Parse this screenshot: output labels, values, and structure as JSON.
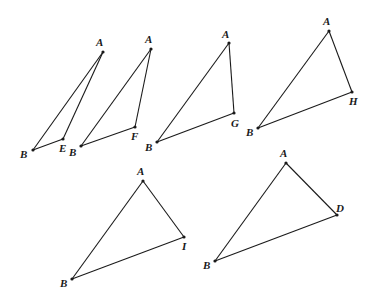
{
  "figure": {
    "width": 381,
    "height": 303,
    "line_color": "#1a1a1a",
    "background": "#ffffff",
    "triangles": [
      {
        "name": "ABE",
        "vertices": {
          "A": {
            "x": 103,
            "y": 52,
            "label": "A",
            "lx": 96,
            "ly": 46
          },
          "B": {
            "x": 33,
            "y": 150,
            "label": "B",
            "lx": 20,
            "ly": 158
          },
          "P": {
            "x": 63,
            "y": 139,
            "label": "E",
            "lx": 59,
            "ly": 152
          }
        }
      },
      {
        "name": "ABF",
        "vertices": {
          "A": {
            "x": 151,
            "y": 49,
            "label": "A",
            "lx": 145,
            "ly": 43
          },
          "B": {
            "x": 81,
            "y": 146,
            "label": "B",
            "lx": 69,
            "ly": 156
          },
          "P": {
            "x": 135,
            "y": 127,
            "label": "F",
            "lx": 131,
            "ly": 140
          }
        }
      },
      {
        "name": "ABG",
        "vertices": {
          "A": {
            "x": 229,
            "y": 43,
            "label": "A",
            "lx": 222,
            "ly": 38
          },
          "B": {
            "x": 157,
            "y": 142,
            "label": "B",
            "lx": 145,
            "ly": 151
          },
          "P": {
            "x": 234,
            "y": 113,
            "label": "G",
            "lx": 231,
            "ly": 127
          }
        }
      },
      {
        "name": "ABH",
        "vertices": {
          "A": {
            "x": 329,
            "y": 31,
            "label": "A",
            "lx": 323,
            "ly": 25
          },
          "B": {
            "x": 258,
            "y": 128,
            "label": "B",
            "lx": 246,
            "ly": 136
          },
          "P": {
            "x": 352,
            "y": 92,
            "label": "H",
            "lx": 349,
            "ly": 105
          }
        }
      },
      {
        "name": "ABI",
        "vertices": {
          "A": {
            "x": 143,
            "y": 181,
            "label": "A",
            "lx": 137,
            "ly": 175
          },
          "B": {
            "x": 72,
            "y": 279,
            "label": "B",
            "lx": 60,
            "ly": 287
          },
          "P": {
            "x": 184,
            "y": 237,
            "label": "I",
            "lx": 182,
            "ly": 250
          }
        }
      },
      {
        "name": "ABD",
        "vertices": {
          "A": {
            "x": 286,
            "y": 163,
            "label": "A",
            "lx": 280,
            "ly": 157
          },
          "B": {
            "x": 215,
            "y": 261,
            "label": "B",
            "lx": 203,
            "ly": 269
          },
          "P": {
            "x": 337,
            "y": 215,
            "label": "D",
            "lx": 336,
            "ly": 212
          }
        }
      }
    ]
  }
}
